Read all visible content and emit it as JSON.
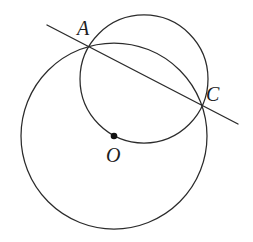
{
  "figure": {
    "background_color": "#ffffff",
    "stroke_color": "#2b2b2b",
    "label_color": "#1d1d1d",
    "width": 253,
    "height": 242,
    "labels": {
      "A": "A",
      "C": "C",
      "O": "O"
    },
    "points": [
      {
        "name": "A",
        "label": "A",
        "x": 92,
        "y": 47,
        "type": "intersection"
      },
      {
        "name": "C",
        "label": "C",
        "x": 204,
        "y": 105,
        "type": "intersection"
      },
      {
        "name": "O",
        "label": "O",
        "x": 114,
        "y": 136,
        "type": "center",
        "marked": true
      }
    ],
    "circles": [
      {
        "name": "large-circle",
        "cx": 114,
        "cy": 136,
        "r": 93
      },
      {
        "name": "upper-circle",
        "cx": 144,
        "cy": 79,
        "r": 64
      }
    ],
    "lines": [
      {
        "name": "secant-line",
        "x1": 47,
        "y1": 25,
        "x2": 238,
        "y2": 124,
        "through": [
          "A",
          "C"
        ]
      }
    ]
  },
  "chart_data": {
    "type": "diagram",
    "elements": [
      {
        "kind": "circle",
        "id": "large-circle",
        "center": [
          114,
          136
        ],
        "radius": 93
      },
      {
        "kind": "circle",
        "id": "upper-circle",
        "center": [
          144,
          79
        ],
        "radius": 64
      },
      {
        "kind": "line",
        "id": "secant-line",
        "from": [
          47,
          25
        ],
        "to": [
          238,
          124
        ]
      },
      {
        "kind": "point",
        "id": "A",
        "at": [
          92,
          47
        ],
        "label": "A"
      },
      {
        "kind": "point",
        "id": "C",
        "at": [
          204,
          105
        ],
        "label": "C"
      },
      {
        "kind": "point",
        "id": "O",
        "at": [
          114,
          136
        ],
        "label": "O",
        "filled": true
      }
    ]
  }
}
